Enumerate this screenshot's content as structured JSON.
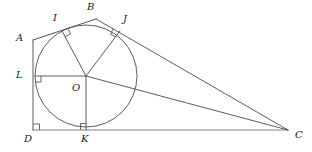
{
  "figure": {
    "stroke_color": "#4a4a4a",
    "label_color": "#1a1a1a",
    "background_color": "#ffffff",
    "points": {
      "A": {
        "label": "A",
        "x": 33,
        "y": 40,
        "label_x": 16,
        "label_y": 33
      },
      "B": {
        "label": "B",
        "x": 96,
        "y": 19,
        "label_x": 87,
        "label_y": 2
      },
      "C": {
        "label": "C",
        "x": 288,
        "y": 130,
        "label_x": 295,
        "label_y": 130
      },
      "D": {
        "label": "D",
        "x": 33,
        "y": 130,
        "label_x": 24,
        "label_y": 134
      },
      "I": {
        "label": "I",
        "x": 62,
        "y": 31,
        "label_x": 53,
        "label_y": 13
      },
      "J": {
        "label": "J",
        "x": 120,
        "y": 31,
        "label_x": 123,
        "label_y": 14
      },
      "K": {
        "label": "K",
        "x": 86,
        "y": 130,
        "label_x": 81,
        "label_y": 134
      },
      "L": {
        "label": "L",
        "x": 35,
        "y": 76,
        "label_x": 16,
        "label_y": 70
      },
      "O": {
        "label": "O",
        "x": 86,
        "y": 76,
        "label_x": 72,
        "label_y": 83
      }
    },
    "circle": {
      "center_x": 86,
      "center_y": 76,
      "radius": 51
    },
    "segments": [
      {
        "name": "A-B",
        "from": "A",
        "to": "B"
      },
      {
        "name": "B-C",
        "from": "B",
        "to": "C"
      },
      {
        "name": "A-D",
        "from": "A",
        "to": "D"
      },
      {
        "name": "D-C",
        "from": "D",
        "to": "C"
      },
      {
        "name": "O-C",
        "from": "O",
        "to": "C"
      },
      {
        "name": "O-I",
        "from": "O",
        "to": "I"
      },
      {
        "name": "O-J",
        "from": "O",
        "to": "J"
      },
      {
        "name": "O-K",
        "from": "O",
        "to": "K"
      },
      {
        "name": "O-L",
        "from": "O",
        "to": "L"
      }
    ],
    "right_angles": [
      {
        "name": "right-angle-I",
        "at": "I"
      },
      {
        "name": "right-angle-J",
        "at": "J"
      },
      {
        "name": "right-angle-K",
        "at": "K"
      },
      {
        "name": "right-angle-L",
        "at": "L"
      },
      {
        "name": "right-angle-D",
        "at": "D"
      }
    ]
  }
}
